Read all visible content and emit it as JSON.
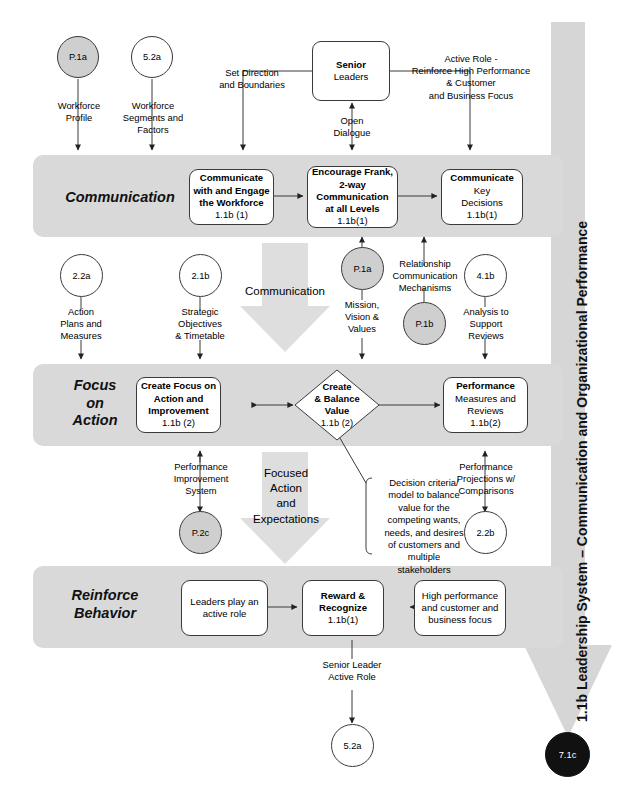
{
  "title": "1.1b Leadership System – Communication and Organizational Performance",
  "side_title": "1.1b  Leadership System – Communication and Organizational Performance",
  "bands": [
    {
      "name": "communication",
      "label": "Communication"
    },
    {
      "name": "focus-on-action",
      "label": "Focus\non\nAction",
      "line1": "Focus",
      "line2": "on",
      "line3": "Action"
    },
    {
      "name": "reinforce-behavior",
      "label": "Reinforce\nBehavior",
      "line1": "Reinforce",
      "line2": "Behavior"
    }
  ],
  "boxes": {
    "senior_leaders": {
      "line1": "Senior",
      "line2": "Leaders"
    },
    "communicate_engage": {
      "line1": "Communicate",
      "line2": "with and Engage",
      "line3": "the Workforce",
      "code": "1.1b (1)"
    },
    "encourage_frank": {
      "line1": "Encourage Frank,",
      "line2": "2-way",
      "line3": "Communication",
      "line4": "at all Levels",
      "code": "1.1b(1)"
    },
    "communicate_key": {
      "line1": "Communicate",
      "line2": "Key",
      "line3": "Decisions",
      "code": "1.1b(1)"
    },
    "create_focus": {
      "line1": "Create Focus on",
      "line2": "Action and",
      "line3": "Improvement",
      "code": "1.1b (2)"
    },
    "create_balance_value": {
      "line1": "Create",
      "line2": "& Balance",
      "line3": "Value",
      "code": "1.1b (2)"
    },
    "performance_measures": {
      "line1": "Performance",
      "line2": "Measures and",
      "line3": "Reviews",
      "code": "1.1b(2)"
    },
    "leaders_active_role": {
      "line1": "Leaders play an",
      "line2": "active role"
    },
    "reward_recognize": {
      "line1": "Reward &",
      "line2": "Recognize",
      "code": "1.1b(1)"
    },
    "high_performance": {
      "line1": "High performance",
      "line2": "and customer and",
      "line3": "business focus"
    }
  },
  "circles": [
    {
      "name": "p1a-top",
      "label": "P.1a",
      "style": "grey"
    },
    {
      "name": "52a-top",
      "label": "5.2a",
      "style": "white"
    },
    {
      "name": "22a",
      "label": "2.2a",
      "style": "white"
    },
    {
      "name": "21b",
      "label": "2.1b",
      "style": "white"
    },
    {
      "name": "p1a-mid",
      "label": "P.1a",
      "style": "grey"
    },
    {
      "name": "p1b-mid",
      "label": "P.1b",
      "style": "grey"
    },
    {
      "name": "41b",
      "label": "4.1b",
      "style": "white"
    },
    {
      "name": "p2c",
      "label": "P.2c",
      "style": "grey"
    },
    {
      "name": "22b",
      "label": "2.2b",
      "style": "white"
    },
    {
      "name": "52a-bot",
      "label": "5.2a",
      "style": "white"
    },
    {
      "name": "71c",
      "label": "7.1c",
      "style": "black"
    }
  ],
  "flow_labels": {
    "workforce_profile": "Workforce\nProfile",
    "workforce_profile_l1": "Workforce",
    "workforce_profile_l2": "Profile",
    "workforce_segments_l1": "Workforce",
    "workforce_segments_l2": "Segments and",
    "workforce_segments_l3": "Factors",
    "set_direction_l1": "Set Direction",
    "set_direction_l2": "and Boundaries",
    "open_dialogue_l1": "Open",
    "open_dialogue_l2": "Dialogue",
    "active_role_l1": "Active Role -",
    "active_role_l2": "Reinforce High Performance",
    "active_role_l3": "& Customer",
    "active_role_l4": "and Business Focus",
    "action_plans_l1": "Action",
    "action_plans_l2": "Plans and",
    "action_plans_l3": "Measures",
    "strategic_obj_l1": "Strategic",
    "strategic_obj_l2": "Objectives",
    "strategic_obj_l3": "& Timetable",
    "communication_arrow": "Communication",
    "mission_vision_l1": "Mission,",
    "mission_vision_l2": "Vision &",
    "mission_vision_l3": "Values",
    "relationship_l1": "Relationship",
    "relationship_l2": "Communication",
    "relationship_l3": "Mechanisms",
    "analysis_l1": "Analysis to",
    "analysis_l2": "Support",
    "analysis_l3": "Reviews",
    "perf_improvement_l1": "Performance",
    "perf_improvement_l2": "Improvement",
    "perf_improvement_l3": "System",
    "focused_action_l1": "Focused",
    "focused_action_l2": "Action",
    "focused_action_l3": "and",
    "focused_action_l4": "Expectations",
    "perf_projections_l1": "Performance",
    "perf_projections_l2": "Projections w/",
    "perf_projections_l3": "Comparisons",
    "senior_leader_role_l1": "Senior Leader",
    "senior_leader_role_l2": "Active Role"
  },
  "note": {
    "l1": "Decision criteria/",
    "l2": "model to balance",
    "l3": "value for the",
    "l4": "competing wants,",
    "l5": "needs, and desires",
    "l6": "of customers and",
    "l7": "multiple",
    "l8": "stakeholders"
  },
  "colors": {
    "band": "#d9d9d9",
    "grey_circle": "#cfcfcf",
    "black_circle": "#111111",
    "big_arrow": "#dedede",
    "line": "#3a3a3a"
  }
}
